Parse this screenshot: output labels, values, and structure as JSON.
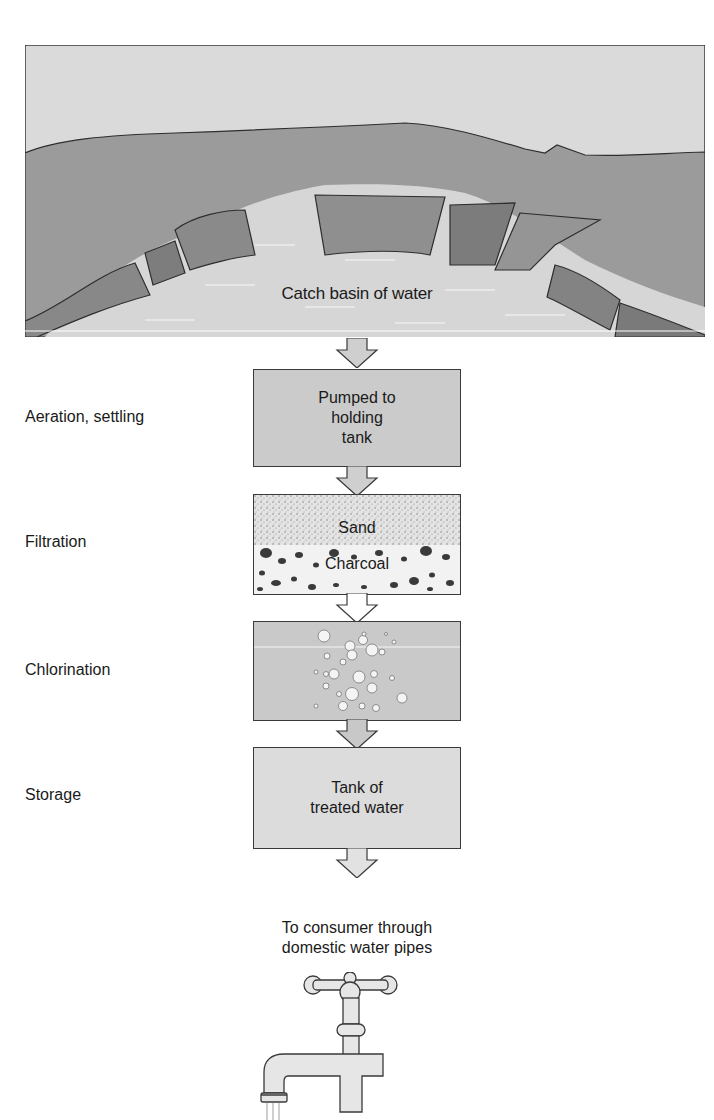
{
  "diagram": {
    "title_source": {
      "basin_label": "Catch basin of water"
    },
    "steps": [
      {
        "label": "Aeration, settling",
        "box_text": [
          "Pumped to",
          "holding",
          "tank"
        ]
      },
      {
        "label": "Filtration",
        "box_text": [
          "Sand",
          "Charcoal"
        ]
      },
      {
        "label": "Chlorination",
        "box_text": []
      },
      {
        "label": "Storage",
        "box_text": [
          "Tank of",
          "treated water"
        ]
      }
    ],
    "final": {
      "line1": "To consumer through",
      "line2": "domestic water pipes"
    },
    "icons": [
      "basin-landscape-icon",
      "down-arrow-icon",
      "sand-charcoal-filter-icon",
      "chlorine-bubbles-icon",
      "water-tap-icon"
    ],
    "colors": {
      "sky": "#d9d9d9",
      "land": "#9a9a9a",
      "cliff": "#858585",
      "water": "#d4d4d4",
      "box_gray": "#cbcbcb",
      "outline": "#3a3a3a"
    }
  }
}
